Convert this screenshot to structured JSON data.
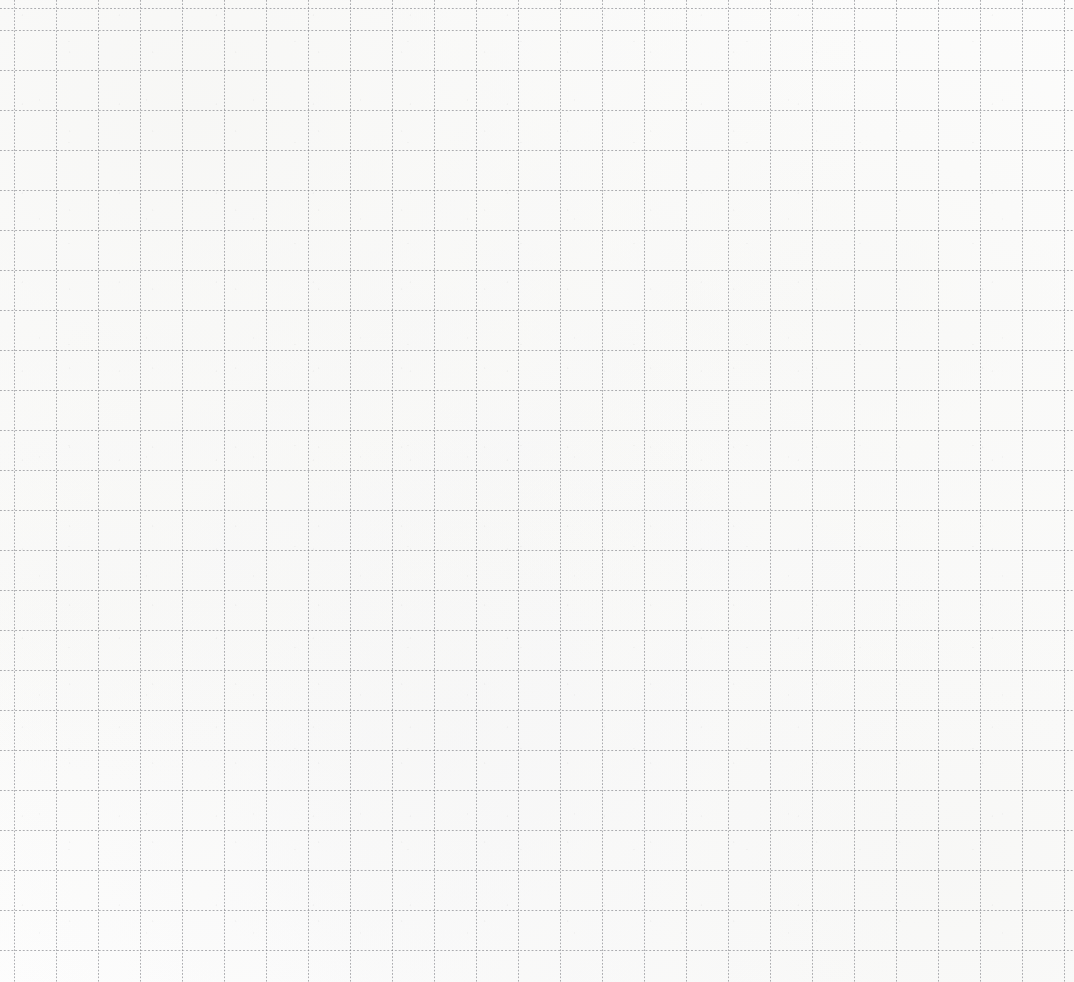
{
  "page": {
    "kind": "grid-paper-scan",
    "width": 1074,
    "height": 982,
    "has_text": false,
    "has_ui_chrome": false,
    "visible_labels": []
  },
  "paper": {
    "background_color": "#fdfdfd",
    "tint_color": "#f6f6f4"
  },
  "grid": {
    "line_style": "dotted",
    "line_color": "#787a80",
    "line_opacity": 0.6,
    "line_width_px": 1,
    "vertical": {
      "spacing_px": 42,
      "first_line_x_px": 14,
      "count": 26
    },
    "horizontal": {
      "spacing_px": 40,
      "first_line_y_px": 30,
      "count": 24
    }
  },
  "margins": {
    "left_px": 14,
    "top_px": 30
  }
}
